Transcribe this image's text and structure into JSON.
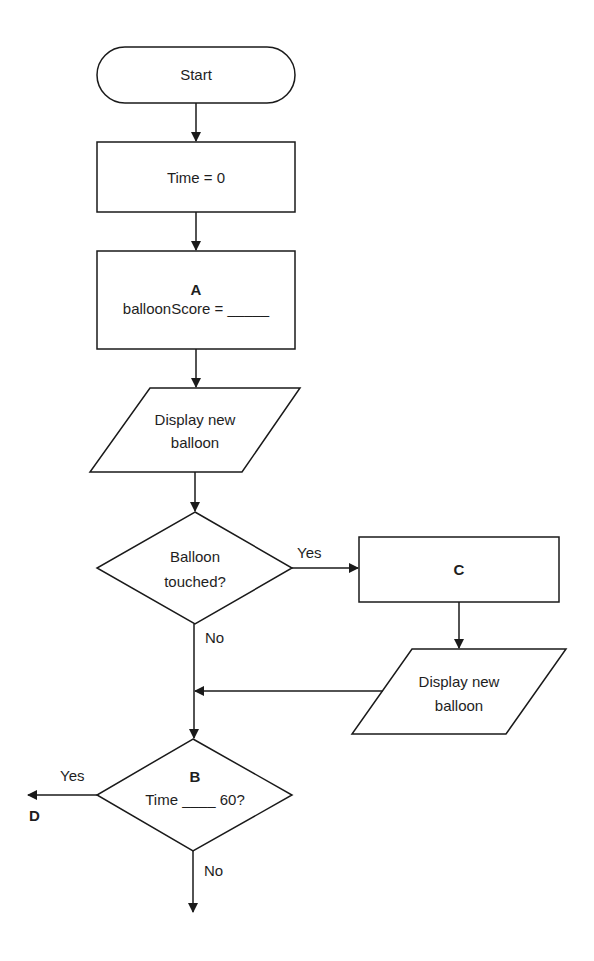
{
  "flowchart": {
    "start": {
      "label": "Start"
    },
    "init_time": {
      "label": "Time = 0"
    },
    "step_a": {
      "tag": "A",
      "label": "balloonScore = _____"
    },
    "display1": {
      "line1": "Display new",
      "line2": "balloon"
    },
    "decision_touched": {
      "line1": "Balloon",
      "line2": "touched?",
      "yes_label": "Yes",
      "no_label": "No"
    },
    "step_c": {
      "tag": "C"
    },
    "display2": {
      "line1": "Display new",
      "line2": "balloon"
    },
    "decision_b": {
      "tag": "B",
      "label": "Time ____ 60?",
      "yes_label": "Yes",
      "no_label": "No",
      "yes_target": "D"
    }
  },
  "colors": {
    "stroke": "#1a1a1a",
    "background": "#ffffff"
  }
}
